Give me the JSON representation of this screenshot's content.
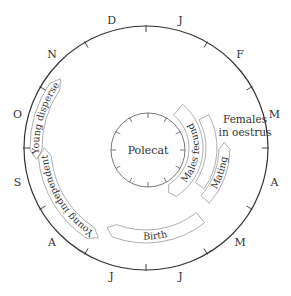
{
  "diagram": {
    "title": "Polecat",
    "center": [
      146,
      148
    ],
    "outer_radius": 122,
    "inner_center": [
      148,
      150
    ],
    "inner_radius": 37,
    "months": [
      "J",
      "F",
      "M",
      "A",
      "M",
      "J",
      "J",
      "A",
      "S",
      "O",
      "N",
      "D"
    ],
    "month_label_radius": 133,
    "side_labels": {
      "females_line1": "Females",
      "females_line2": "in oestrus"
    },
    "bands": [
      {
        "id": "males-fecund",
        "label": "Males fecund",
        "r_in": 43,
        "r_out": 57,
        "start": 40,
        "end": 153,
        "point_start": false,
        "point_end": true,
        "text_reverse": true
      },
      {
        "id": "females-oestrus",
        "label": "",
        "r_in": 60,
        "r_out": 71,
        "start": 62,
        "end": 125,
        "point_start": false,
        "point_end": false,
        "text_reverse": true
      },
      {
        "id": "mating",
        "label": "Mating",
        "r_in": 73,
        "r_out": 84,
        "start": 86,
        "end": 131,
        "point_start": true,
        "point_end": false,
        "text_reverse": true
      },
      {
        "id": "birth",
        "label": "Birth",
        "r_in": 82,
        "r_out": 95,
        "start": 142,
        "end": 206,
        "point_start": false,
        "point_end": true,
        "text_reverse": true
      },
      {
        "id": "young-independent",
        "label": "Young  independent",
        "r_in": 95,
        "r_out": 108,
        "start": 208,
        "end": 270,
        "point_start": true,
        "point_end": true,
        "text_reverse": false
      },
      {
        "id": "young-disperse",
        "label": "Young disperse",
        "r_in": 104,
        "r_out": 116,
        "start": 264,
        "end": 309,
        "point_start": true,
        "point_end": true,
        "text_reverse": false
      }
    ]
  }
}
